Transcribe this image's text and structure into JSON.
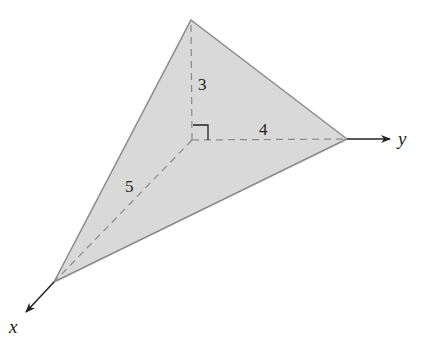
{
  "diagram": {
    "type": "tetrahedron-3d-axes",
    "colors": {
      "face_fill": "#d9d9d9",
      "edge": "#8a8a8a",
      "axis": "#222222",
      "dashed": "#8a8a8a"
    },
    "vertices": {
      "origin": [
        192,
        140
      ],
      "top": [
        191,
        20
      ],
      "right": [
        347,
        139
      ],
      "bottom_left": [
        54,
        282
      ]
    },
    "axes": {
      "y": {
        "label": "y",
        "tip": [
          390,
          139
        ]
      },
      "x": {
        "label": "x",
        "tip": [
          26,
          312
        ]
      }
    },
    "edge_labels": {
      "vertical": "3",
      "horizontal": "4",
      "diagonal": "5"
    },
    "right_angle_marker": true
  }
}
